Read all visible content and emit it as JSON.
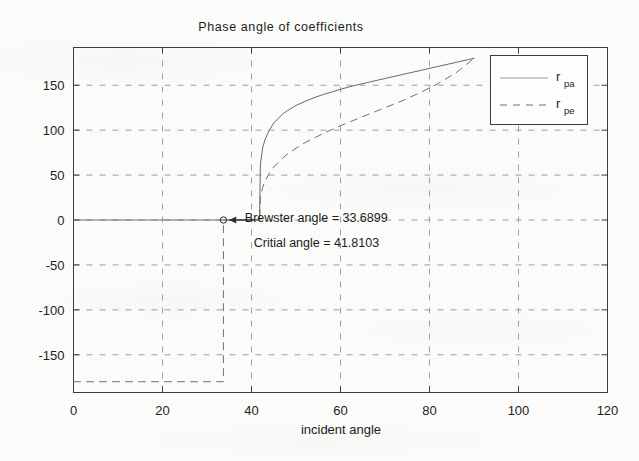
{
  "chart_data": {
    "type": "line",
    "title": "Phase angle of coefficients",
    "xlabel": "incident angle",
    "ylabel": "",
    "xlim": [
      0,
      120
    ],
    "ylim": [
      -192,
      192
    ],
    "xticks": [
      0,
      20,
      40,
      60,
      80,
      100,
      120
    ],
    "yticks": [
      150,
      100,
      50,
      0,
      -50,
      -100,
      -150
    ],
    "xtick_labels": [
      "0",
      "20",
      "40",
      "60",
      "80",
      "100",
      "120"
    ],
    "ytick_labels": [
      "150",
      "100",
      "50",
      "0",
      "-50",
      "-100",
      "-150"
    ],
    "grid": true,
    "grid_style": "dashed",
    "legend_position": "top-right",
    "series": [
      {
        "name": "r_pa",
        "label": "r",
        "sublabel": "pa",
        "style": "solid",
        "color": "#6a6a6a",
        "points": [
          [
            0,
            0
          ],
          [
            5,
            0
          ],
          [
            10,
            0
          ],
          [
            15,
            0
          ],
          [
            20,
            0
          ],
          [
            25,
            0
          ],
          [
            30,
            0
          ],
          [
            33.6899,
            0
          ],
          [
            36,
            0
          ],
          [
            38,
            0
          ],
          [
            40,
            0
          ],
          [
            41.5,
            0
          ],
          [
            41.8103,
            0
          ],
          [
            42,
            62
          ],
          [
            42.5,
            80
          ],
          [
            43,
            89
          ],
          [
            44,
            100
          ],
          [
            45,
            108
          ],
          [
            46,
            113
          ],
          [
            47,
            118
          ],
          [
            48,
            121.5
          ],
          [
            50,
            127.5
          ],
          [
            52,
            132
          ],
          [
            54,
            136
          ],
          [
            56,
            139.5
          ],
          [
            58,
            142.5
          ],
          [
            60,
            145.5
          ],
          [
            63,
            149.5
          ],
          [
            66,
            153
          ],
          [
            70,
            157.5
          ],
          [
            74,
            162
          ],
          [
            78,
            166.5
          ],
          [
            82,
            171
          ],
          [
            86,
            175.5
          ],
          [
            90,
            180
          ]
        ]
      },
      {
        "name": "r_pe",
        "label": "r",
        "sublabel": "pe",
        "style": "dashed",
        "color": "#707070",
        "points": [
          [
            0,
            -180
          ],
          [
            5,
            -180
          ],
          [
            10,
            -180
          ],
          [
            15,
            -180
          ],
          [
            20,
            -180
          ],
          [
            25,
            -180
          ],
          [
            30,
            -180
          ],
          [
            33.6899,
            -180
          ],
          [
            33.6899,
            0
          ],
          [
            36,
            0
          ],
          [
            38,
            0
          ],
          [
            40,
            0
          ],
          [
            41.5,
            0
          ],
          [
            41.8103,
            0
          ],
          [
            42,
            26
          ],
          [
            42.5,
            36
          ],
          [
            43,
            43
          ],
          [
            44,
            52
          ],
          [
            45,
            59
          ],
          [
            46,
            64
          ],
          [
            47,
            69
          ],
          [
            48,
            73
          ],
          [
            50,
            80
          ],
          [
            52,
            86
          ],
          [
            54,
            91
          ],
          [
            56,
            96
          ],
          [
            58,
            100.5
          ],
          [
            60,
            105
          ],
          [
            63,
            111
          ],
          [
            66,
            117
          ],
          [
            70,
            125
          ],
          [
            74,
            133
          ],
          [
            78,
            142
          ],
          [
            82,
            152
          ],
          [
            86,
            164
          ],
          [
            90,
            180
          ]
        ]
      }
    ],
    "annotations": [
      {
        "name": "brewster-annotation",
        "text": "Brewster angle = 33.6899",
        "x": 38.5,
        "y": 2
      },
      {
        "name": "critical-annotation",
        "text": "Critial angle = 41.8103",
        "x": 40.5,
        "y": -26
      }
    ],
    "markers": [
      {
        "name": "brewster-point-marker",
        "x": 33.6899,
        "y": 0,
        "shape": "circle"
      }
    ],
    "arrow": {
      "name": "brewster-arrow",
      "from_x": 40.5,
      "to_x": 35.0,
      "y": 0
    },
    "values": {
      "brewster_angle": 33.6899,
      "critical_angle": 41.8103,
      "max_phase": 180,
      "min_phase": -180
    }
  },
  "legend": {
    "entries": [
      {
        "label": "r",
        "sublabel": "pa",
        "style": "solid"
      },
      {
        "label": "r",
        "sublabel": "pe",
        "style": "dashed"
      }
    ]
  }
}
